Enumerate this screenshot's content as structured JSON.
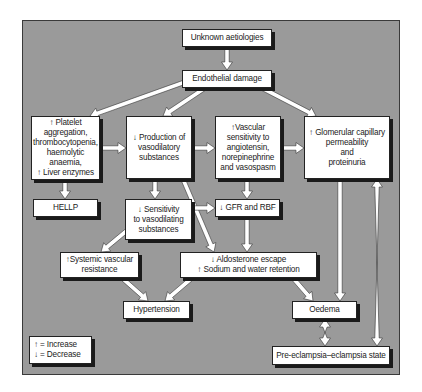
{
  "diagram": {
    "title": "",
    "nodes": {
      "unknown": "Unknown aetiologies",
      "endothelial": "Endothelial damage",
      "platelet": "↑ Platelet\naggregation,\nthrombocytopenia,\nhaemolytic anaemia,\n↑ Liver enzymes",
      "production": "↓ Production of\nvasodilatory\nsubstances",
      "vascular": "↑Vascular\nsensitivity to\nangiotensin,\nnorepinephrine\nand vasospasm",
      "glomerular": "↑ Glomerular capillary\npermeability\nand\nproteinuria",
      "hellp": "HELLP",
      "sensitivity": "↓ Sensitivity\nto vasodilating\nsubstances",
      "gfr": "↓ GFR and RBF",
      "systemic": "↑Systemic vascular\nresistance",
      "aldosterone": "↓ Aldosterone escape\n↑ Sodium and water retention",
      "hypertension": "Hypertension",
      "oedema": "Oedema",
      "preeclampsia": "Pre-eclampsia–eclampsia state"
    },
    "legend": {
      "increase": "↑ = Increase",
      "decrease": "↓ = Decrease"
    },
    "edges": [
      [
        "unknown",
        "endothelial"
      ],
      [
        "endothelial",
        "platelet"
      ],
      [
        "endothelial",
        "production"
      ],
      [
        "endothelial",
        "glomerular"
      ],
      [
        "platelet",
        "production"
      ],
      [
        "production",
        "vascular"
      ],
      [
        "vascular",
        "glomerular"
      ],
      [
        "platelet",
        "hellp"
      ],
      [
        "production",
        "sensitivity"
      ],
      [
        "production",
        "aldosterone"
      ],
      [
        "vascular",
        "gfr"
      ],
      [
        "sensitivity",
        "gfr"
      ],
      [
        "sensitivity",
        "systemic"
      ],
      [
        "gfr",
        "aldosterone"
      ],
      [
        "systemic",
        "hypertension"
      ],
      [
        "aldosterone",
        "hypertension"
      ],
      [
        "aldosterone",
        "oedema"
      ],
      [
        "glomerular",
        "oedema"
      ],
      [
        "oedema",
        "preeclampsia",
        "bidirectional"
      ],
      [
        "glomerular",
        "preeclampsia",
        "bidirectional"
      ]
    ],
    "colors": {
      "background": "#9a9a9a",
      "box": "#ffffff",
      "arrow_fill": "#ffffff",
      "arrow_outline": "#333333"
    }
  }
}
